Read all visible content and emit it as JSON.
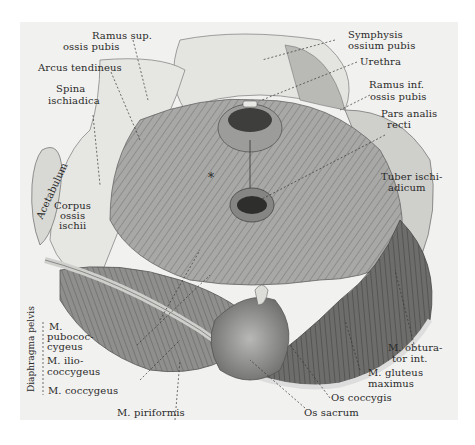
{
  "figure": {
    "center_marker": "*",
    "colors": {
      "background": "#ffffff",
      "panel": "#f1f1ef",
      "ink": "#2a2a2a",
      "bone_light": "#e3e3e0",
      "muscle_mid": "#9a9a98",
      "muscle_dark": "#4a4a48"
    }
  },
  "labels": {
    "ramus_sup": [
      "Ramus sup.",
      "ossis pubis"
    ],
    "arcus_tendineus": "Arcus tendineus",
    "spina_ischiadica": [
      "Spina",
      "ischiadica"
    ],
    "acetabulum": "Acetabulum",
    "corpus_ossis_ischii": [
      "Corpus",
      "ossis",
      "ischii"
    ],
    "symphysis": [
      "Symphysis",
      "ossium pubis"
    ],
    "urethra": "Urethra",
    "ramus_inf": [
      "Ramus inf.",
      "ossis pubis"
    ],
    "pars_analis": [
      "Pars analis",
      "recti"
    ],
    "tuber_ischiadicum": [
      "Tuber ischi-",
      "adicum"
    ],
    "diaphragma_pelvis": "Diaphragma pelvis",
    "m_pubococcygeus": [
      "M.",
      "pubococ-",
      "cygeus"
    ],
    "m_iliococcygeus": [
      "M. ilio-",
      "coccygeus"
    ],
    "m_coccygeus": "M. coccygeus",
    "m_piriformis": "M. piriformis",
    "m_obturator_int": [
      "M. obtura-",
      "tor int."
    ],
    "m_gluteus_maximus": [
      "M. gluteus",
      "maximus"
    ],
    "os_coccygis": "Os coccygis",
    "os_sacrum": "Os sacrum"
  }
}
